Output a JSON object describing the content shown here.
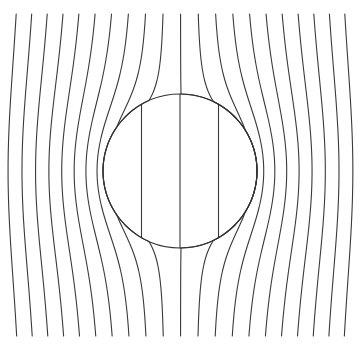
{
  "figure": {
    "type": "streamline-diagram",
    "background_color": "#ffffff",
    "width": 359,
    "height": 350
  },
  "style": {
    "line_color": "#3a3a3a",
    "line_width": 1.1,
    "circle_color": "#333333",
    "circle_width": 1.2
  },
  "chart_data": {
    "type": "line",
    "subtitle": "",
    "xlabel": "",
    "ylabel": "",
    "xlim": [
      0,
      359
    ],
    "ylim": [
      0,
      350
    ],
    "grid": false,
    "legend": "none",
    "annotations": [],
    "tick_labels_x": [],
    "tick_labels_y": [],
    "domain": {
      "x_min": 26,
      "x_max": 335,
      "y_top": 14,
      "y_bottom": 336
    },
    "circle": {
      "cx": 180,
      "cy": 171,
      "r": 77,
      "label": "circular inclusion"
    },
    "exterior": {
      "n_lines": 21,
      "spacing": 15.45,
      "x_start": 26,
      "far_field_direction": "vertical",
      "deflection_model": "2D dipole, contrast k = 0.52"
    },
    "interior": {
      "n_lines": 5,
      "spacing": 38.5,
      "x_positions": [
        103,
        141.5,
        180,
        218.5,
        257
      ],
      "uniform": true
    },
    "series": [
      {
        "name": "streamline-1",
        "x_top": 26.0
      },
      {
        "name": "streamline-2",
        "x_top": 41.5
      },
      {
        "name": "streamline-3",
        "x_top": 56.9
      },
      {
        "name": "streamline-4",
        "x_top": 72.4
      },
      {
        "name": "streamline-5",
        "x_top": 87.8
      },
      {
        "name": "streamline-6",
        "x_top": 103.3
      },
      {
        "name": "streamline-7",
        "x_top": 118.7
      },
      {
        "name": "streamline-8",
        "x_top": 134.2
      },
      {
        "name": "streamline-9",
        "x_top": 149.6
      },
      {
        "name": "streamline-10",
        "x_top": 165.1
      },
      {
        "name": "streamline-11",
        "x_top": 180.5
      },
      {
        "name": "streamline-12",
        "x_top": 196.0
      },
      {
        "name": "streamline-13",
        "x_top": 211.4
      },
      {
        "name": "streamline-14",
        "x_top": 226.9
      },
      {
        "name": "streamline-15",
        "x_top": 242.3
      },
      {
        "name": "streamline-16",
        "x_top": 257.8
      },
      {
        "name": "streamline-17",
        "x_top": 273.2
      },
      {
        "name": "streamline-18",
        "x_top": 288.7
      },
      {
        "name": "streamline-19",
        "x_top": 304.1
      },
      {
        "name": "streamline-20",
        "x_top": 319.6
      },
      {
        "name": "streamline-21",
        "x_top": 335.0
      }
    ]
  }
}
